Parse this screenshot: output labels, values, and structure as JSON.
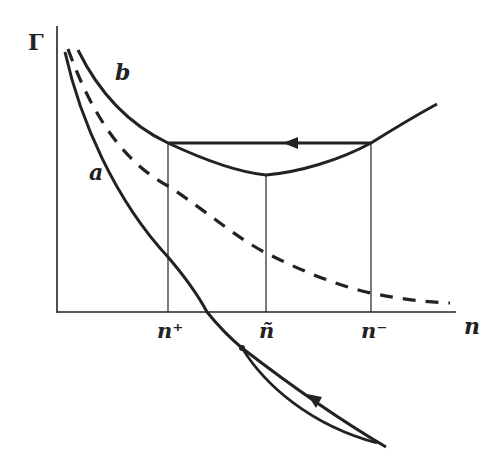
{
  "figure": {
    "y_axis_label": "Γ",
    "x_axis_label": "n",
    "curve_labels": {
      "a": "a",
      "b": "b"
    },
    "tick_labels": {
      "n_plus": "n⁺",
      "n_tilde": "ñ",
      "n_minus": "n⁻"
    },
    "colors": {
      "ink": "#222222",
      "background": "#ffffff"
    },
    "curves": [
      {
        "name": "a",
        "style": "solid",
        "description": "decreasing curve crossing n-axis, continuing below with a small hysteresis loop with arrow"
      },
      {
        "name": "b",
        "style": "solid",
        "description": "decreasing then minimum at ñ then rising"
      },
      {
        "name": "dashed",
        "style": "dashed",
        "description": "monotonically decreasing asymptote curve"
      }
    ],
    "horizontal_transition": {
      "from": "n⁻",
      "to": "n⁺",
      "arrow_direction": "left"
    }
  }
}
